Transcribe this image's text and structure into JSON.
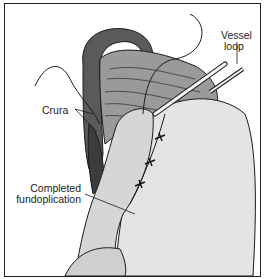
{
  "figure": {
    "labels": {
      "vessel_loop_line1": "Vessel",
      "vessel_loop_line2": "loop",
      "crura": "Crura",
      "fundoplication_line1": "Completed",
      "fundoplication_line2": "fundoplication"
    },
    "colors": {
      "border": "#222222",
      "dark_tissue": "#5a5a5a",
      "mid_tissue": "#8c8c8c",
      "light_tissue": "#d9d9d9",
      "stomach": "#e6e6e6",
      "line": "#1a1a1a"
    }
  }
}
